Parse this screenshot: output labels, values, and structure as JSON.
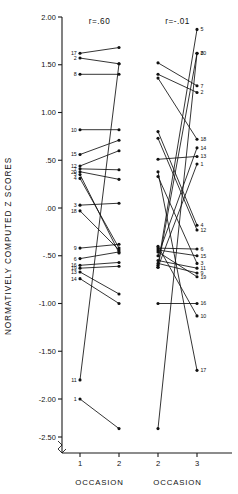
{
  "figure": {
    "y_axis_title": "NORMATIVELY COMPUTED Z SCORES",
    "y_ticks": [
      "2.00",
      "1.50",
      "1.00",
      ".50",
      ".00",
      "-.50",
      "-1.00",
      "-1.50",
      "-2.00",
      "-2.50"
    ],
    "y_tick_values": [
      2.0,
      1.5,
      1.0,
      0.5,
      0.0,
      -0.5,
      -1.0,
      -1.5,
      -2.0,
      -2.5
    ],
    "axis_break": true,
    "panels": [
      {
        "corr_label": "r=.60",
        "x_axis_title": "OCCASION",
        "x_ticks": [
          "1",
          "2"
        ]
      },
      {
        "corr_label": "r=-.01",
        "x_axis_title": "OCCASION",
        "x_ticks": [
          "2",
          "3"
        ]
      }
    ]
  },
  "chart_data": {
    "type": "line",
    "title": "",
    "subtitle": "",
    "xlabel": "OCCASION",
    "ylabel": "NORMATIVELY COMPUTED Z SCORES",
    "ylim": [
      -2.5,
      2.0
    ],
    "grid": false,
    "legend": "none",
    "y_ticks": [
      2.0,
      1.5,
      1.0,
      0.5,
      0.0,
      -0.5,
      -1.0,
      -1.5,
      -2.0,
      -2.5
    ],
    "panels": [
      {
        "name": "left",
        "annotation": "r=.60",
        "correlation": 0.6,
        "x": [
          1,
          2
        ],
        "x_tick_labels": [
          "1",
          "2"
        ],
        "label_side": "left",
        "series": [
          {
            "name": "17",
            "values": [
              1.62,
              1.68
            ]
          },
          {
            "name": "2",
            "values": [
              1.57,
              1.51
            ]
          },
          {
            "name": "8",
            "values": [
              1.4,
              1.4
            ]
          },
          {
            "name": "10",
            "values": [
              0.82,
              0.82
            ]
          },
          {
            "name": "15",
            "values": [
              0.56,
              0.71
            ]
          },
          {
            "name": "12",
            "values": [
              0.44,
              0.6
            ]
          },
          {
            "name": "7",
            "values": [
              0.41,
              0.4
            ]
          },
          {
            "name": "20",
            "values": [
              0.38,
              0.3
            ]
          },
          {
            "name": "5",
            "values": [
              0.35,
              -0.47
            ]
          },
          {
            "name": "4",
            "values": [
              0.31,
              -0.42
            ]
          },
          {
            "name": "3",
            "values": [
              0.03,
              0.05
            ]
          },
          {
            "name": "18",
            "values": [
              -0.03,
              -0.44
            ]
          },
          {
            "name": "9",
            "values": [
              -0.42,
              -0.38
            ]
          },
          {
            "name": "6",
            "values": [
              -0.53,
              -0.46
            ]
          },
          {
            "name": "16",
            "values": [
              -0.6,
              -0.57
            ]
          },
          {
            "name": "19",
            "values": [
              -0.63,
              -0.61
            ]
          },
          {
            "name": "13",
            "values": [
              -0.67,
              -0.9
            ]
          },
          {
            "name": "14",
            "values": [
              -0.74,
              -1.0
            ]
          },
          {
            "name": "11",
            "values": [
              -1.8,
              1.51
            ]
          },
          {
            "name": "1",
            "values": [
              -2.0,
              -2.38
            ]
          }
        ]
      },
      {
        "name": "right",
        "annotation": "r=-.01",
        "correlation": -0.01,
        "x": [
          2,
          3
        ],
        "x_tick_labels": [
          "2",
          "3"
        ],
        "label_side": "right",
        "series": [
          {
            "name": "5",
            "values": [
              -0.6,
              1.87
            ]
          },
          {
            "name": "8",
            "values": [
              -0.62,
              1.62
            ]
          },
          {
            "name": "7",
            "values": [
              1.52,
              1.28
            ]
          },
          {
            "name": "2",
            "values": [
              1.4,
              1.21
            ]
          },
          {
            "name": "18",
            "values": [
              1.36,
              0.72
            ]
          },
          {
            "name": "14",
            "values": [
              -0.5,
              0.63
            ]
          },
          {
            "name": "13",
            "values": [
              0.51,
              0.54
            ]
          },
          {
            "name": "1",
            "values": [
              -0.62,
              0.46
            ]
          },
          {
            "name": "4",
            "values": [
              0.8,
              -0.18
            ]
          },
          {
            "name": "12",
            "values": [
              0.73,
              -0.23
            ]
          },
          {
            "name": "6",
            "values": [
              -0.42,
              -0.43
            ]
          },
          {
            "name": "15",
            "values": [
              -0.44,
              -0.5
            ]
          },
          {
            "name": "3",
            "values": [
              0.33,
              -0.58
            ]
          },
          {
            "name": "11",
            "values": [
              -0.55,
              -0.63
            ]
          },
          {
            "name": "9",
            "values": [
              -0.58,
              -0.68
            ]
          },
          {
            "name": "19",
            "values": [
              -0.46,
              -0.72
            ]
          },
          {
            "name": "16",
            "values": [
              -1.0,
              -1.0
            ]
          },
          {
            "name": "10",
            "values": [
              -0.4,
              -1.13
            ]
          },
          {
            "name": "17",
            "values": [
              0.38,
              -1.7
            ]
          },
          {
            "name": "20",
            "values": [
              -2.38,
              1.62
            ]
          }
        ]
      }
    ]
  }
}
